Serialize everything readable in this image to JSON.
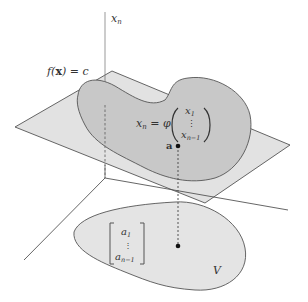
{
  "figure": {
    "labels": {
      "axis_xn": "x",
      "axis_xn_sub": "n",
      "level_set_f": "f(",
      "level_set_x": "x",
      "level_set_rest": ") = c",
      "eq_lhs_x": "x",
      "eq_lhs_sub": "n",
      "eq_equals_phi": " = φ",
      "eq_x1": "x",
      "eq_x1_sub": "1",
      "eq_vdots": "⋮",
      "eq_xn1": "x",
      "eq_xn1_sub": "n−1",
      "point_a": "a",
      "vec_a1": "a",
      "vec_a1_sub": "1",
      "vec_vdots": "⋮",
      "vec_an1": "a",
      "vec_an1_sub": "n−1",
      "region_V": "V"
    },
    "colors": {
      "plane_fill": "#e2e2e2",
      "surface_fill": "#c8c8c8",
      "region_fill": "#e4e4e4",
      "stroke": "#555555",
      "point": "#111111"
    }
  }
}
